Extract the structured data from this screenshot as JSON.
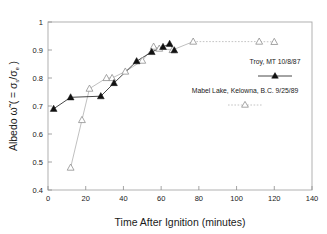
{
  "chart_data": {
    "type": "scatter",
    "title": "",
    "xlabel": "Time After Ignition (minutes)",
    "ylabel": "Albedo ω̃ ( = σs/σe )",
    "ylabel_parts": {
      "main": "Albedo ω̃ ( = σ",
      "sub1": "s",
      "mid": "/σ",
      "sub2": "e",
      "end": " )"
    },
    "xlim": [
      0,
      140
    ],
    "ylim": [
      0.4,
      1.0
    ],
    "xticks": [
      0,
      20,
      40,
      60,
      80,
      100,
      120,
      140
    ],
    "xtick_labels": [
      "0",
      "20",
      "40",
      "60",
      "80",
      "100",
      "120",
      "140"
    ],
    "yticks": [
      0.4,
      0.5,
      0.6,
      0.7,
      0.8,
      0.9,
      1.0
    ],
    "ytick_labels": [
      "0.4",
      "0.5",
      "0.6",
      "0.7",
      "0.8",
      "0.9",
      "1"
    ],
    "grid": false,
    "legend_position": "right-middle",
    "series": [
      {
        "name": "Troy, MT 10/8/87",
        "marker": "filled-triangle",
        "linestyle": "solid",
        "color": "#111111",
        "x": [
          3,
          12,
          28,
          35,
          47,
          55,
          61,
          64.5,
          67
        ],
        "y": [
          0.69,
          0.731,
          0.735,
          0.782,
          0.86,
          0.893,
          0.911,
          0.922,
          0.899
        ]
      },
      {
        "name": "Mabel Lake, Kelowna, B.C. 9/25/89",
        "marker": "open-triangle",
        "linestyle": "solid-then-dotted",
        "color": "#9a9a9a",
        "x": [
          12,
          18,
          22,
          31,
          34,
          41,
          50,
          56,
          59,
          66,
          77,
          112,
          120
        ],
        "y": [
          0.48,
          0.65,
          0.762,
          0.8,
          0.8,
          0.823,
          0.862,
          0.912,
          0.905,
          0.9,
          0.93,
          0.93,
          0.929
        ]
      }
    ]
  },
  "legend": {
    "items": [
      {
        "label": "Troy, MT 10/8/87",
        "marker": "filled-triangle"
      },
      {
        "label": "Mabel Lake, Kelowna, B.C. 9/25/89",
        "marker": "open-triangle"
      }
    ]
  },
  "colors": {
    "series1": "#111111",
    "series2": "#9a9a9a",
    "frame": "#a8a8a8",
    "text": "#1a1a1a",
    "background": "#ffffff"
  }
}
